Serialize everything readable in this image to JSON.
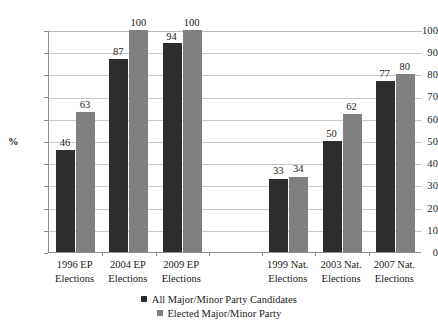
{
  "chart_data": {
    "type": "bar",
    "title": "",
    "xlabel": "",
    "ylabel": "%",
    "ylim": [
      0,
      100
    ],
    "ytick_step": 10,
    "yticks": [
      100,
      90,
      80,
      70,
      60,
      50,
      40,
      30,
      20,
      10,
      0
    ],
    "grid": "horizontal",
    "legend_position": "bottom",
    "categories": [
      "1996 EP Elections",
      "2004 EP Elections",
      "2009 EP Elections",
      "",
      "1999 Nat. Elections",
      "2003 Nat. Elections",
      "2007 Nat. Elections"
    ],
    "category_lines": [
      [
        "1996 EP",
        "Elections"
      ],
      [
        "2004 EP",
        "Elections"
      ],
      [
        "2009 EP",
        "Elections"
      ],
      [
        "",
        ""
      ],
      [
        "1999 Nat.",
        "Elections"
      ],
      [
        "2003 Nat.",
        "Elections"
      ],
      [
        "2007 Nat.",
        "Elections"
      ]
    ],
    "series": [
      {
        "name": "All Major/Minor Party Candidates",
        "color": "#2d2d2d",
        "values": [
          46,
          87,
          94,
          null,
          33,
          50,
          77
        ]
      },
      {
        "name": "Elected Major/Minor Party",
        "color": "#808080",
        "values": [
          63,
          100,
          100,
          null,
          34,
          62,
          80
        ]
      }
    ],
    "data_labels": [
      [
        "46",
        "63"
      ],
      [
        "87",
        "100"
      ],
      [
        "94",
        "100"
      ],
      [
        "",
        ""
      ],
      [
        "33",
        "34"
      ],
      [
        "50",
        "62"
      ],
      [
        "77",
        "80"
      ]
    ]
  },
  "legend": {
    "items": [
      {
        "label": "All Major/Minor Party Candidates",
        "color": "#2d2d2d"
      },
      {
        "label": "Elected Major/Minor Party",
        "color": "#808080"
      }
    ]
  },
  "axis": {
    "y_title": "%",
    "y_labels": [
      "100",
      "90",
      "80",
      "70",
      "60",
      "50",
      "40",
      "30",
      "20",
      "10",
      "0"
    ]
  }
}
